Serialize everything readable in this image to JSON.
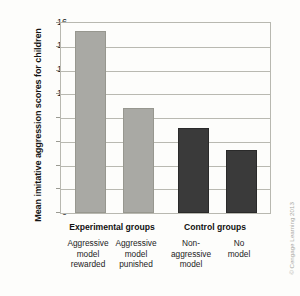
{
  "chart_data": {
    "type": "bar",
    "title": "",
    "xlabel": "",
    "ylabel": "Mean imitative aggression scores for children",
    "ylim": [
      0,
      16
    ],
    "ytick_step": 2,
    "yticks": [
      16,
      14,
      12,
      10,
      8,
      6,
      4,
      2,
      0
    ],
    "grid": true,
    "legend": "none",
    "categories": [
      "Aggressive model rewarded",
      "Aggressive model punished",
      "Non-aggressive model",
      "No model"
    ],
    "category_lines": [
      [
        "Aggressive",
        "model",
        "rewarded"
      ],
      [
        "Aggressive",
        "model",
        "punished"
      ],
      [
        "Non-",
        "aggressive",
        "model"
      ],
      [
        "No",
        "model"
      ]
    ],
    "values": [
      15.2,
      8.7,
      7.0,
      5.1
    ],
    "bar_colors": [
      "#a9a9a4",
      "#a9a9a4",
      "#3a3a3a",
      "#3a3a3a"
    ],
    "groups": [
      {
        "label": "Experimental groups",
        "members": [
          0,
          1
        ]
      },
      {
        "label": "Control groups",
        "members": [
          2,
          3
        ]
      }
    ]
  },
  "credit": "© Cengage Learning 2013",
  "colors": {
    "light_bar": "#a9a9a4",
    "dark_bar": "#3a3a3a",
    "gridline": "#b9b9b1",
    "frame": "#b8b8b0",
    "background": "#fdfdfb"
  }
}
